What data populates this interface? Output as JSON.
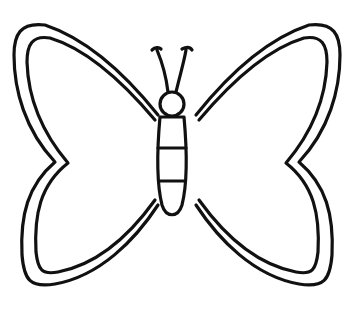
{
  "image": {
    "subject": "butterfly coloring page outline",
    "colors": {
      "background": "#ffffff",
      "stroke": "#111111"
    }
  }
}
